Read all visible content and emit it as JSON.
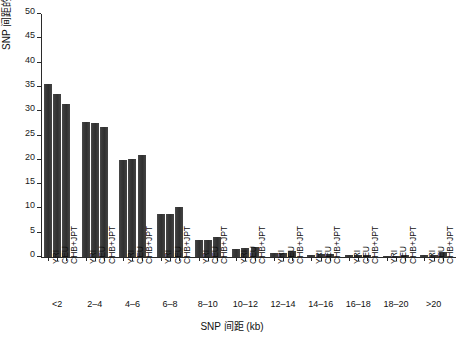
{
  "chart_data": {
    "type": "bar",
    "title": "",
    "subtitle": "",
    "xlabel": "SNP 间距 (kb)",
    "ylabel": "SNP 间距的比例 (%)",
    "ylim": [
      0,
      50
    ],
    "yticks": [
      0,
      5,
      10,
      15,
      20,
      25,
      30,
      35,
      40,
      45,
      50
    ],
    "ytick_labels": [
      "0",
      "5",
      "10",
      "15",
      "20",
      "25",
      "30",
      "35",
      "40",
      "45",
      "50"
    ],
    "grid": false,
    "legend": "none",
    "bar_color": "#3a3a3a",
    "categories": [
      "<2",
      "2–4",
      "4–6",
      "6–8",
      "8–10",
      "10–12",
      "12–14",
      "14–16",
      "16–18",
      "18–20",
      ">20"
    ],
    "series": [
      {
        "name": "YRI",
        "values": [
          35.6,
          27.7,
          20.0,
          8.8,
          3.4,
          1.7,
          0.9,
          0.5,
          0.4,
          0.3,
          0.4
        ]
      },
      {
        "name": "CEU",
        "values": [
          33.5,
          27.6,
          20.1,
          8.8,
          3.6,
          1.8,
          0.9,
          0.6,
          0.4,
          0.3,
          0.5
        ]
      },
      {
        "name": "CHB+JPT",
        "values": [
          31.4,
          26.7,
          20.9,
          10.3,
          4.2,
          2.1,
          1.2,
          0.7,
          0.5,
          0.4,
          1.1
        ]
      }
    ]
  }
}
